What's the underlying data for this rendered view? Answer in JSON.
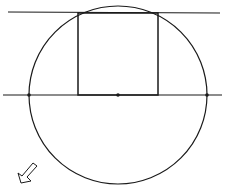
{
  "diagram": {
    "stroke_color": "#1a1a1a",
    "background": "#ffffff",
    "circle": {
      "cx": 118,
      "cy": 95,
      "r": 89
    },
    "top_line": {
      "x1": 8,
      "y1": 12,
      "x2": 220,
      "y2": 13
    },
    "diameter_line": {
      "x1": 3,
      "y1": 95,
      "x2": 222,
      "y2": 95
    },
    "square": {
      "x": 78,
      "y": 13,
      "width": 80,
      "height": 82
    },
    "points": [
      {
        "name": "left-intersection",
        "x": 29,
        "y": 95
      },
      {
        "name": "center",
        "x": 118,
        "y": 95
      },
      {
        "name": "right-intersection",
        "x": 207,
        "y": 95
      }
    ],
    "arrow": {
      "direction": "down-left",
      "x": 18,
      "y": 178
    }
  }
}
